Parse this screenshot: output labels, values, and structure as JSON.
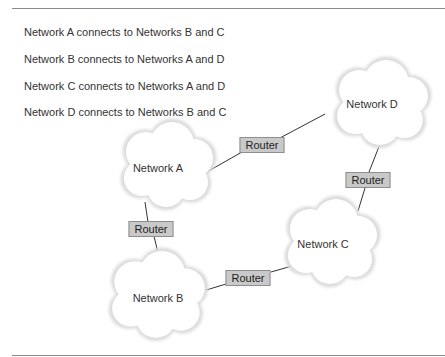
{
  "descriptions": [
    "Network A connects to Networks B and C",
    "Network B connects to Networks A and D",
    "Network C connects to Networks A and D",
    "Network D connects to Networks B and C"
  ],
  "networks": {
    "a": "Network A",
    "b": "Network B",
    "c": "Network C",
    "d": "Network D"
  },
  "routers": {
    "ad": "Router",
    "ab": "Router",
    "dc": "Router",
    "bc": "Router"
  },
  "colors": {
    "router_fill": "#c9c9c9",
    "router_border": "#8e8e8e",
    "cloud_edge": "#e4e4e4",
    "line": "#333333"
  }
}
